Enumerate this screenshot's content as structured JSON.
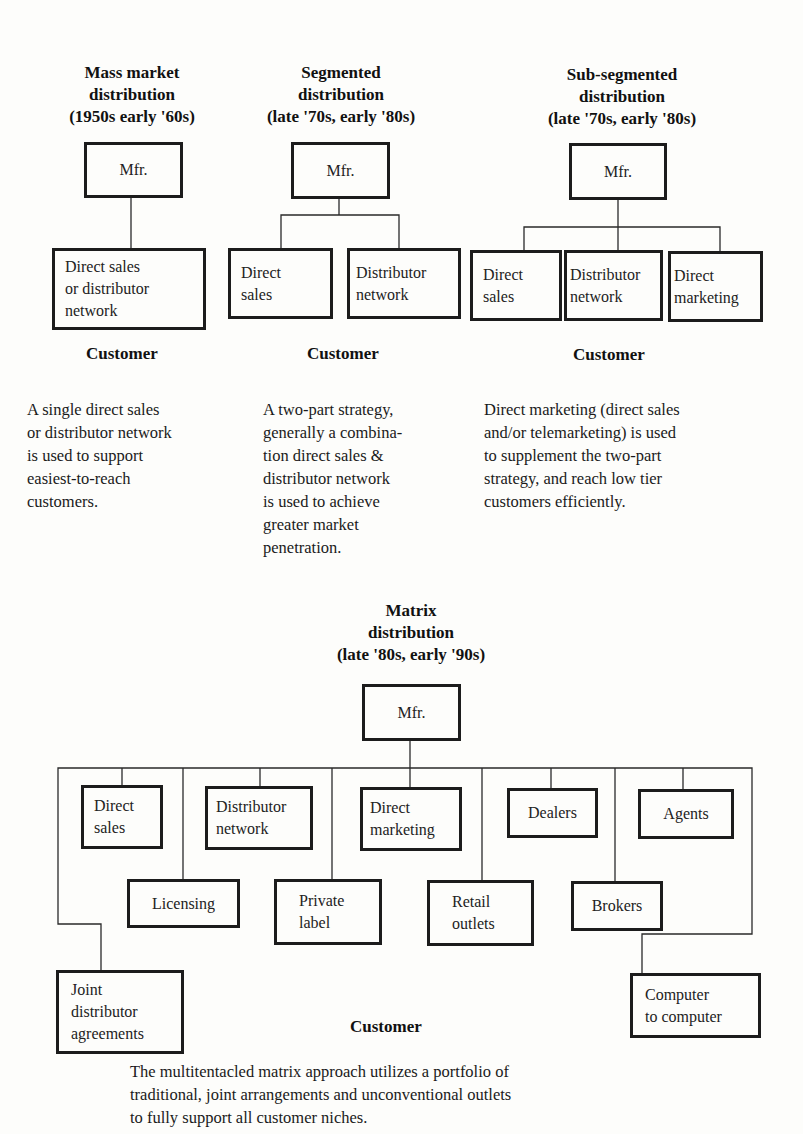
{
  "panels": [
    {
      "title": [
        "Mass market",
        "distribution",
        "(1950s early '60s)"
      ],
      "root": "Mfr.",
      "channels": [
        "Direct sales\nor distributor\nnetwork"
      ],
      "customer": "Customer",
      "description": "A single direct sales\nor distributor network\nis used to support\neasiest-to-reach\ncustomers."
    },
    {
      "title": [
        "Segmented",
        "distribution",
        "(late '70s, early '80s)"
      ],
      "root": "Mfr.",
      "channels": [
        "Direct\nsales",
        "Distributor\nnetwork"
      ],
      "customer": "Customer",
      "description": "A two-part strategy,\ngenerally a combina-\ntion direct sales &\ndistributor network\nis used to achieve\ngreater market\npenetration."
    },
    {
      "title": [
        "Sub-segmented",
        "distribution",
        "(late '70s, early '80s)"
      ],
      "root": "Mfr.",
      "channels": [
        "Direct\nsales",
        "Distributor\nnetwork",
        "Direct\nmarketing"
      ],
      "customer": "Customer",
      "description": "Direct marketing (direct sales\nand/or telemarketing) is used\nto supplement the two-part\nstrategy, and reach low tier\ncustomers efficiently."
    }
  ],
  "matrix": {
    "title": [
      "Matrix",
      "distribution",
      "(late '80s, early '90s)"
    ],
    "root": "Mfr.",
    "channels": {
      "direct_sales": "Direct\nsales",
      "distributor_network": "Distributor\nnetwork",
      "direct_marketing": "Direct\nmarketing",
      "dealers": "Dealers",
      "agents": "Agents",
      "licensing": "Licensing",
      "private_label": "Private\nlabel",
      "retail_outlets": "Retail\noutlets",
      "brokers": "Brokers",
      "joint_distributor_agreements": "Joint\ndistributor\nagreements",
      "computer_to_computer": "Computer\nto computer"
    },
    "customer": "Customer",
    "description": "The multitentacled matrix approach utilizes a portfolio of\ntraditional, joint arrangements and unconventional outlets\nto fully support all customer niches."
  }
}
